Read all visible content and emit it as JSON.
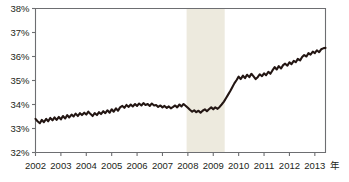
{
  "chart_data": {
    "type": "line",
    "title": "",
    "xlabel": "年",
    "ylabel": "",
    "grid": false,
    "legend": "none",
    "xlim": [
      2002.0,
      2013.42
    ],
    "ylim": [
      32,
      38
    ],
    "y_ticks": [
      "32%",
      "33%",
      "34%",
      "35%",
      "36%",
      "37%",
      "38%"
    ],
    "y_tick_values": [
      32,
      33,
      34,
      35,
      36,
      37,
      38
    ],
    "x_ticks": [
      "2002",
      "2003",
      "2004",
      "2005",
      "2006",
      "2007",
      "2008",
      "2009",
      "2010",
      "2011",
      "2012",
      "2013"
    ],
    "x_tick_values": [
      2002,
      2003,
      2004,
      2005,
      2006,
      2007,
      2008,
      2009,
      2010,
      2011,
      2012,
      2013
    ],
    "line_color": "#231613",
    "shaded_band": {
      "label": "recession",
      "color": "#edeade",
      "x_start": 2007.95,
      "x_end": 2009.45
    },
    "series": [
      {
        "name": "series-1",
        "color": "#231613",
        "x": [
          2002.0,
          2002.08,
          2002.17,
          2002.25,
          2002.33,
          2002.42,
          2002.5,
          2002.58,
          2002.67,
          2002.75,
          2002.83,
          2002.92,
          2003.0,
          2003.08,
          2003.17,
          2003.25,
          2003.33,
          2003.42,
          2003.5,
          2003.58,
          2003.67,
          2003.75,
          2003.83,
          2003.92,
          2004.0,
          2004.08,
          2004.17,
          2004.25,
          2004.33,
          2004.42,
          2004.5,
          2004.58,
          2004.67,
          2004.75,
          2004.83,
          2004.92,
          2005.0,
          2005.08,
          2005.17,
          2005.25,
          2005.33,
          2005.42,
          2005.5,
          2005.58,
          2005.67,
          2005.75,
          2005.83,
          2005.92,
          2006.0,
          2006.08,
          2006.17,
          2006.25,
          2006.33,
          2006.42,
          2006.5,
          2006.58,
          2006.67,
          2006.75,
          2006.83,
          2006.92,
          2007.0,
          2007.08,
          2007.17,
          2007.25,
          2007.33,
          2007.42,
          2007.5,
          2007.58,
          2007.67,
          2007.75,
          2007.83,
          2007.92,
          2008.0,
          2008.08,
          2008.17,
          2008.25,
          2008.33,
          2008.42,
          2008.5,
          2008.58,
          2008.67,
          2008.75,
          2008.83,
          2008.92,
          2009.0,
          2009.08,
          2009.17,
          2009.25,
          2009.33,
          2009.42,
          2009.5,
          2009.58,
          2009.67,
          2009.75,
          2009.83,
          2009.92,
          2010.0,
          2010.08,
          2010.17,
          2010.25,
          2010.33,
          2010.42,
          2010.5,
          2010.58,
          2010.67,
          2010.75,
          2010.83,
          2010.92,
          2011.0,
          2011.08,
          2011.17,
          2011.25,
          2011.33,
          2011.42,
          2011.5,
          2011.58,
          2011.67,
          2011.75,
          2011.83,
          2011.92,
          2012.0,
          2012.08,
          2012.17,
          2012.25,
          2012.33,
          2012.42,
          2012.5,
          2012.58,
          2012.67,
          2012.75,
          2012.83,
          2012.92,
          2013.0,
          2013.08,
          2013.17,
          2013.25,
          2013.33,
          2013.42
        ],
        "y": [
          33.4,
          33.3,
          33.22,
          33.36,
          33.26,
          33.4,
          33.3,
          33.44,
          33.34,
          33.46,
          33.36,
          33.48,
          33.38,
          33.52,
          33.42,
          33.56,
          33.46,
          33.58,
          33.5,
          33.62,
          33.52,
          33.64,
          33.56,
          33.66,
          33.58,
          33.7,
          33.6,
          33.52,
          33.64,
          33.56,
          33.68,
          33.6,
          33.72,
          33.64,
          33.76,
          33.66,
          33.8,
          33.7,
          33.84,
          33.74,
          33.88,
          33.94,
          33.86,
          33.98,
          33.9,
          34.0,
          33.92,
          34.02,
          33.94,
          34.04,
          33.96,
          34.06,
          33.98,
          34.02,
          33.94,
          34.04,
          33.96,
          33.98,
          33.9,
          33.96,
          33.88,
          33.94,
          33.86,
          33.92,
          33.84,
          33.9,
          33.96,
          33.88,
          34.0,
          33.92,
          34.02,
          33.94,
          33.86,
          33.78,
          33.7,
          33.76,
          33.68,
          33.74,
          33.66,
          33.74,
          33.8,
          33.72,
          33.8,
          33.88,
          33.8,
          33.88,
          33.82,
          33.9,
          34.0,
          34.12,
          34.26,
          34.4,
          34.56,
          34.72,
          34.88,
          35.02,
          35.16,
          35.06,
          35.2,
          35.1,
          35.24,
          35.14,
          35.28,
          35.18,
          35.06,
          35.14,
          35.26,
          35.18,
          35.3,
          35.22,
          35.36,
          35.28,
          35.42,
          35.56,
          35.46,
          35.6,
          35.5,
          35.64,
          35.7,
          35.62,
          35.76,
          35.68,
          35.82,
          35.76,
          35.9,
          35.84,
          35.98,
          36.06,
          36.0,
          36.14,
          36.08,
          36.2,
          36.14,
          36.26,
          36.18,
          36.3,
          36.34,
          36.36
        ]
      }
    ]
  }
}
